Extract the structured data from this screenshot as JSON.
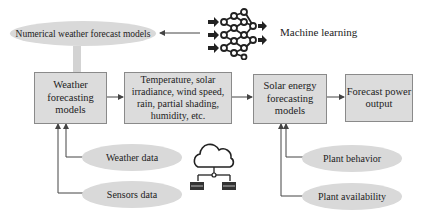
{
  "diagram": {
    "nodes": {
      "nwp": {
        "label": "Numerical weather forecast models",
        "shape": "ellipse"
      },
      "ml": {
        "label": "Machine learning",
        "icon": "neural-network-icon"
      },
      "weather_models": {
        "label": "Weather forecasting models",
        "shape": "box"
      },
      "variables": {
        "label": "Temperature, solar irradiance, wind speed, rain, partial shading, humidity, etc.",
        "shape": "box"
      },
      "solar_models": {
        "label": "Solar energy forecasting models",
        "shape": "box"
      },
      "output": {
        "label": "Forecast power output",
        "shape": "box"
      },
      "weather_data": {
        "label": "Weather data",
        "shape": "ellipse"
      },
      "sensors_data": {
        "label": "Sensors data",
        "shape": "ellipse"
      },
      "plant_behavior": {
        "label": "Plant behavior",
        "shape": "ellipse"
      },
      "plant_availability": {
        "label": "Plant availability",
        "shape": "ellipse"
      },
      "cloud": {
        "icon": "cloud-servers-icon"
      }
    },
    "edges": [
      {
        "from": "ml",
        "to": "nwp"
      },
      {
        "from": "nwp",
        "to": "weather_models"
      },
      {
        "from": "weather_models",
        "to": "variables"
      },
      {
        "from": "variables",
        "to": "solar_models"
      },
      {
        "from": "solar_models",
        "to": "output"
      },
      {
        "from": "weather_data",
        "to": "weather_models"
      },
      {
        "from": "sensors_data",
        "to": "weather_models"
      },
      {
        "from": "plant_behavior",
        "to": "solar_models"
      },
      {
        "from": "plant_availability",
        "to": "solar_models"
      }
    ],
    "colors": {
      "fill": "#dcdcdc",
      "border": "#8a8a8a",
      "line": "#555555"
    }
  }
}
